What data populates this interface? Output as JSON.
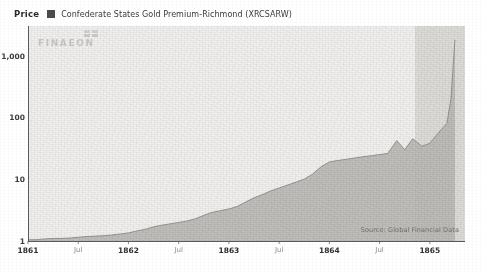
{
  "header": {
    "price_label": "Price",
    "legend_swatch_color": "#4a4a4a",
    "series_title": "Confederate States Gold Premium-Richmond (XRCSARW)"
  },
  "watermark": {
    "text": "FINAEON",
    "mark_name": "finaeon-squares-logo"
  },
  "footer": {
    "source": "Source: Global Financial Data"
  },
  "chart_data": {
    "type": "area",
    "title": "Confederate States Gold Premium-Richmond (XRCSARW)",
    "ylabel": "Price",
    "xlabel": "",
    "yscale": "log",
    "ylim": [
      1,
      3000
    ],
    "grid": false,
    "legend_position": "top-left",
    "legend": [
      "Confederate States Gold Premium-Richmond (XRCSARW)"
    ],
    "ytick_labels": [
      "1,000",
      "100",
      "10",
      "1"
    ],
    "ytick_values": [
      1000,
      100,
      10,
      1
    ],
    "xtick_labels": [
      "1861",
      "Jul",
      "1862",
      "Jul",
      "1863",
      "Jul",
      "1864",
      "Jul",
      "1865"
    ],
    "xtick_values": [
      1861.0,
      1861.5,
      1862.0,
      1862.5,
      1863.0,
      1863.5,
      1864.0,
      1864.5,
      1865.0
    ],
    "xlim": [
      1861.0,
      1865.35
    ],
    "highlight_band": {
      "start": 1864.85,
      "end": 1865.5,
      "color": "#d9d8d5"
    },
    "series": [
      {
        "name": "Confederate States Gold Premium-Richmond (XRCSARW)",
        "fill_color": "#b9b8b5",
        "line_color": "#8e8d8a",
        "x": [
          1861.0,
          1861.08,
          1861.17,
          1861.25,
          1861.33,
          1861.42,
          1861.5,
          1861.58,
          1861.67,
          1861.75,
          1861.83,
          1861.92,
          1862.0,
          1862.08,
          1862.17,
          1862.25,
          1862.33,
          1862.42,
          1862.5,
          1862.58,
          1862.67,
          1862.75,
          1862.83,
          1862.92,
          1863.0,
          1863.08,
          1863.17,
          1863.25,
          1863.33,
          1863.42,
          1863.5,
          1863.58,
          1863.67,
          1863.75,
          1863.83,
          1863.92,
          1864.0,
          1864.08,
          1864.17,
          1864.25,
          1864.33,
          1864.42,
          1864.5,
          1864.58,
          1864.67,
          1864.75,
          1864.83,
          1864.92,
          1865.0,
          1865.08,
          1865.17,
          1865.21,
          1865.25
        ],
        "y": [
          1.05,
          1.05,
          1.08,
          1.1,
          1.1,
          1.12,
          1.15,
          1.18,
          1.2,
          1.22,
          1.25,
          1.3,
          1.35,
          1.45,
          1.55,
          1.7,
          1.8,
          1.9,
          2.0,
          2.1,
          2.3,
          2.6,
          2.9,
          3.1,
          3.3,
          3.6,
          4.3,
          5.0,
          5.6,
          6.5,
          7.2,
          8.0,
          9.0,
          10.0,
          12.0,
          16.0,
          19.0,
          20.0,
          21.0,
          22.0,
          23.0,
          24.0,
          25.0,
          26.0,
          42.0,
          30.0,
          45.0,
          34.0,
          38.0,
          55.0,
          80.0,
          200.0,
          1800.0
        ]
      }
    ],
    "annotations": [
      {
        "text": "Source: Global Financial Data",
        "position": "bottom-right"
      }
    ]
  }
}
